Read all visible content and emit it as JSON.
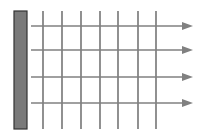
{
  "diagram": {
    "bar": {
      "x": 14,
      "y": 11,
      "width": 13,
      "height": 118,
      "fill": "#7a7a7a",
      "stroke": "#333333"
    },
    "vertical_lines": {
      "xs": [
        43,
        62,
        81,
        100,
        118,
        138,
        156
      ],
      "y1": 11,
      "y2": 129,
      "color": "#555555"
    },
    "arrows": {
      "ys": [
        26,
        50,
        77,
        103
      ],
      "x1": 31,
      "x2": 193,
      "color": "#808080"
    }
  }
}
